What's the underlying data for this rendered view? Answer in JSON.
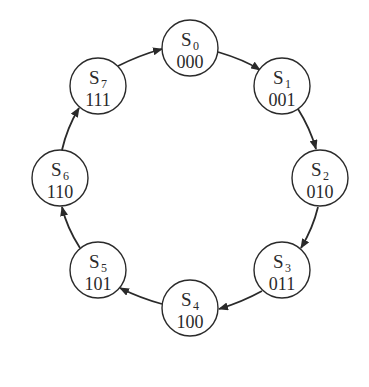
{
  "diagram": {
    "type": "state-cycle",
    "colors": {
      "stroke": "#2a2a2a",
      "background": "#ffffff",
      "node_fill": "#ffffff"
    },
    "states": [
      {
        "name": "S",
        "index": "0",
        "code": "000"
      },
      {
        "name": "S",
        "index": "1",
        "code": "001"
      },
      {
        "name": "S",
        "index": "2",
        "code": "010"
      },
      {
        "name": "S",
        "index": "3",
        "code": "011"
      },
      {
        "name": "S",
        "index": "4",
        "code": "100"
      },
      {
        "name": "S",
        "index": "5",
        "code": "101"
      },
      {
        "name": "S",
        "index": "6",
        "code": "110"
      },
      {
        "name": "S",
        "index": "7",
        "code": "111"
      }
    ],
    "transitions": [
      {
        "from": "S0",
        "to": "S1"
      },
      {
        "from": "S1",
        "to": "S2"
      },
      {
        "from": "S2",
        "to": "S3"
      },
      {
        "from": "S3",
        "to": "S4"
      },
      {
        "from": "S4",
        "to": "S5"
      },
      {
        "from": "S5",
        "to": "S6"
      },
      {
        "from": "S6",
        "to": "S7"
      },
      {
        "from": "S7",
        "to": "S0"
      }
    ]
  }
}
